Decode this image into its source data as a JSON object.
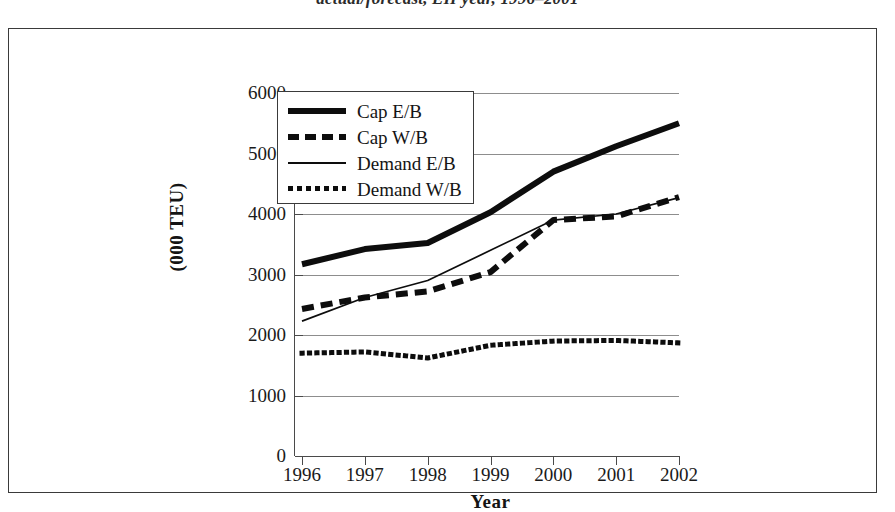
{
  "caption": "actual/forecast, EH year, 1996–2001",
  "figure": {
    "x_axis_title": "Year",
    "y_axis_title": "(000 TEU)"
  },
  "legend": {
    "position": "inside-top-left",
    "items": [
      {
        "label": "Cap E/B",
        "style": "thick-solid",
        "swatch": "line-thick-solid-icon"
      },
      {
        "label": "Cap W/B",
        "style": "thick-dash",
        "swatch": "line-thick-dashed-icon"
      },
      {
        "label": "Demand E/B",
        "style": "thin-solid",
        "swatch": "line-thin-solid-icon"
      },
      {
        "label": "Demand W/B",
        "style": "dotted",
        "swatch": "line-dotted-icon"
      }
    ]
  },
  "chart_data": {
    "type": "line",
    "title": "actual/forecast, EH year, 1996–2001",
    "xlabel": "Year",
    "ylabel": "(000 TEU)",
    "categories": [
      "1996",
      "1997",
      "1998",
      "1999",
      "2000",
      "2001",
      "2002"
    ],
    "xlim": [
      1996,
      2002
    ],
    "ylim": [
      0,
      6000
    ],
    "ytick_labels": [
      "0",
      "1000",
      "2000",
      "3000",
      "4000",
      "5000",
      "6000"
    ],
    "ytick_values": [
      0,
      1000,
      2000,
      3000,
      4000,
      5000,
      6000
    ],
    "grid": "horizontal",
    "legend_position": "inside-top-left",
    "series": [
      {
        "name": "Cap E/B",
        "style": "thick-solid",
        "color": "#0d0d0d",
        "values": [
          3170,
          3420,
          3520,
          4030,
          4700,
          5120,
          5500
        ]
      },
      {
        "name": "Cap W/B",
        "style": "thick-dash",
        "color": "#0d0d0d",
        "values": [
          2430,
          2620,
          2720,
          3040,
          3900,
          3960,
          4280
        ]
      },
      {
        "name": "Demand E/B",
        "style": "thin-solid",
        "color": "#0d0d0d",
        "values": [
          2230,
          2620,
          2900,
          3400,
          3900,
          4000,
          4270
        ]
      },
      {
        "name": "Demand W/B",
        "style": "dotted",
        "color": "#0d0d0d",
        "values": [
          1700,
          1720,
          1620,
          1830,
          1900,
          1910,
          1870
        ]
      }
    ]
  }
}
